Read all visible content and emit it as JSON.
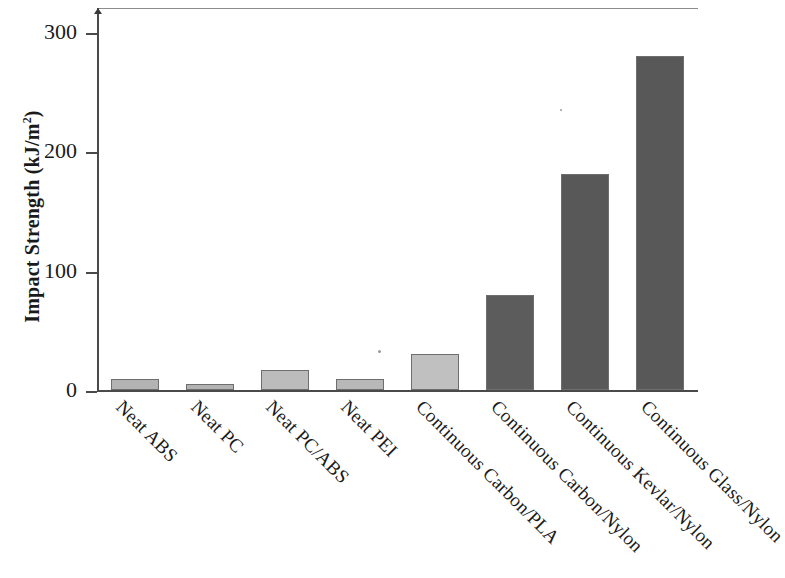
{
  "chart_data": {
    "type": "bar",
    "title": "",
    "xlabel": "",
    "ylabel": "Impact Strength (kJ/m2)",
    "ylabel_main": "Impact Strength (kJ/m",
    "ylabel_sup": "2",
    "ylabel_tail": ")",
    "ylim": [
      0,
      320
    ],
    "yticks": [
      0,
      100,
      200,
      300
    ],
    "ytick_labels": [
      "0",
      "100",
      "200",
      "300"
    ],
    "grid": false,
    "legend": null,
    "categories": [
      "Neat ABS",
      "Neat PC",
      "Neat PC/ABS",
      "Neat PEI",
      "Continuous Carbon/PLA",
      "Continuous Carbon/Nylon",
      "Continuous Kevlar/Nylon",
      "Continuous Glass/Nylon"
    ],
    "values": [
      9,
      5,
      17,
      9,
      30,
      80,
      181,
      280
    ],
    "bar_colors": [
      "#b3b3b3",
      "#b3b3b3",
      "#bcbcbc",
      "#b8b8b8",
      "#c0c0c0",
      "#5c5c5c",
      "#585858",
      "#585858"
    ],
    "bar_edge_color": "#6e6e6e",
    "axis_color": "#4a4a4a"
  }
}
